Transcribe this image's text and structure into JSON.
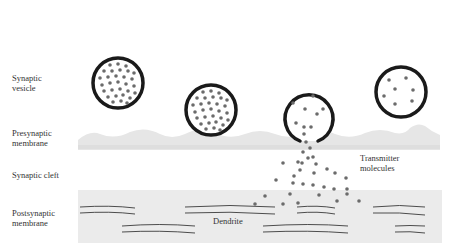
{
  "labels": {
    "synaptic_vesicle": "Synaptic\nvesicle",
    "presynaptic_membrane": "Presynaptic\nmembrane",
    "synaptic_cleft": "Synaptic cleft",
    "postsynaptic_membrane": "Postsynaptic\nmembrane",
    "transmitter_molecules": "Transmitter\nmolecules",
    "dendrite": "Dendrite"
  },
  "colors": {
    "background": "#ffffff",
    "membrane_fill": "#e8e8e8",
    "vesicle_outline": "#1a1a1a",
    "molecule": "#6b6b6b",
    "text": "#333333",
    "fiber_line": "#3a3a3a"
  }
}
